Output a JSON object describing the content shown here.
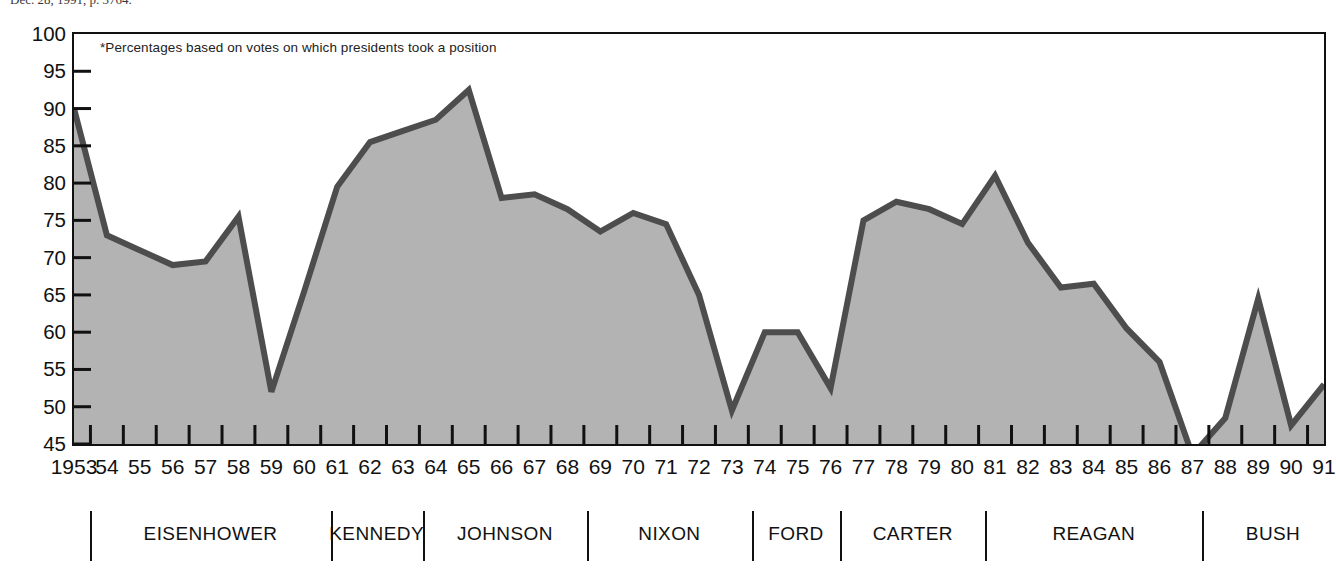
{
  "source_note": "Dec. 28, 1991, p. 3764.",
  "chart_note": "*Percentages based on votes on which presidents took a position",
  "colors": {
    "area_fill": "#b3b3b3",
    "line": "#4d4d4d",
    "axis": "#111111",
    "background": "#ffffff"
  },
  "chart_data": {
    "type": "area",
    "title": "",
    "xlabel": "",
    "ylabel": "Percent",
    "ylim": [
      45,
      100
    ],
    "ytick_step": 5,
    "yticks": [
      100,
      95,
      90,
      85,
      80,
      75,
      70,
      65,
      60,
      55,
      50,
      45
    ],
    "ytick_labels": [
      "100",
      "95",
      "90",
      "85",
      "80",
      "75",
      "70",
      "65",
      "60",
      "55",
      "50",
      "45"
    ],
    "grid": false,
    "legend": null,
    "annotations": [
      "*Percentages based on votes on which presidents took a position"
    ],
    "x": [
      1953,
      1954,
      1955,
      1956,
      1957,
      1958,
      1959,
      1960,
      1961,
      1962,
      1963,
      1964,
      1965,
      1966,
      1967,
      1968,
      1969,
      1970,
      1971,
      1972,
      1973,
      1974,
      1975,
      1976,
      1977,
      1978,
      1979,
      1980,
      1981,
      1982,
      1983,
      1984,
      1985,
      1986,
      1987,
      1988,
      1989,
      1990,
      1991
    ],
    "xtick_labels": [
      "1953",
      "54",
      "55",
      "56",
      "57",
      "58",
      "59",
      "60",
      "61",
      "62",
      "63",
      "64",
      "65",
      "66",
      "67",
      "68",
      "69",
      "70",
      "71",
      "72",
      "73",
      "74",
      "75",
      "76",
      "77",
      "78",
      "79",
      "80",
      "81",
      "82",
      "83",
      "84",
      "85",
      "86",
      "87",
      "88",
      "89",
      "90",
      "91"
    ],
    "values": [
      90.0,
      73.0,
      71.0,
      69.0,
      69.5,
      75.5,
      52.0,
      65.5,
      79.5,
      85.5,
      87.0,
      88.5,
      92.5,
      78.0,
      78.5,
      76.5,
      73.5,
      76.0,
      74.5,
      65.0,
      49.5,
      60.0,
      60.0,
      52.5,
      75.0,
      77.5,
      76.5,
      74.5,
      81.0,
      72.0,
      66.0,
      66.5,
      60.5,
      56.0,
      43.5,
      48.5,
      64.5,
      47.5,
      53.0
    ],
    "series_name": "Presidential success rate on congressional votes"
  },
  "presidents": [
    {
      "name": "EISENHOWER",
      "start_year": 1953,
      "end_year": 1960
    },
    {
      "name": "KENNEDY",
      "start_year": 1961,
      "end_year": 1963
    },
    {
      "name": "JOHNSON",
      "start_year": 1964,
      "end_year": 1968
    },
    {
      "name": "NIXON",
      "start_year": 1969,
      "end_year": 1974
    },
    {
      "name": "FORD",
      "start_year": 1974,
      "end_year": 1976
    },
    {
      "name": "CARTER",
      "start_year": 1977,
      "end_year": 1980
    },
    {
      "name": "REAGAN",
      "start_year": 1981,
      "end_year": 1988
    },
    {
      "name": "BUSH",
      "start_year": 1989,
      "end_year": 1991
    }
  ],
  "president_dividers": [
    1953.5,
    1960.8,
    1963.6,
    1968.6,
    1973.6,
    1976.3,
    1980.7,
    1987.3
  ]
}
